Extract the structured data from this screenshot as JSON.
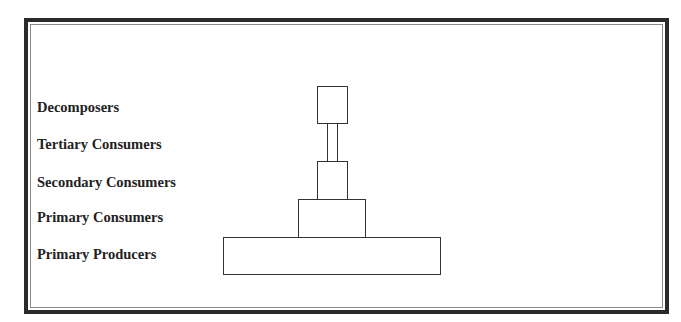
{
  "diagram": {
    "type": "ecological-pyramid",
    "border_color": "#2a2a2a",
    "inner_border_color": "#8a8a8a",
    "box_stroke_color": "#333333",
    "text_color": "#222222"
  },
  "levels": [
    {
      "label": "Decomposers",
      "box": {
        "x": 317,
        "y": 86,
        "w": 31,
        "h": 38
      }
    },
    {
      "label": "Tertiary Consumers",
      "box": {
        "x": 327,
        "y": 123,
        "w": 11,
        "h": 39
      }
    },
    {
      "label": "Secondary Consumers",
      "box": {
        "x": 317,
        "y": 161,
        "w": 31,
        "h": 39
      }
    },
    {
      "label": "Primary Consumers",
      "box": {
        "x": 298,
        "y": 199,
        "w": 68,
        "h": 39
      }
    },
    {
      "label": "Primary Producers",
      "box": {
        "x": 223,
        "y": 237,
        "w": 218,
        "h": 38
      }
    }
  ]
}
